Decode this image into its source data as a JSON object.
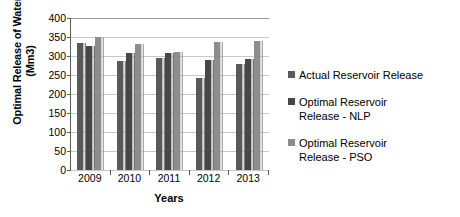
{
  "chart_data": {
    "type": "bar",
    "title": "",
    "xlabel": "Years",
    "ylabel": "Optimal Release of Water (Mm3)",
    "ylabel_line1": "Optimal Release of Water",
    "ylabel_line2": "(Mm3)",
    "categories": [
      "2009",
      "2010",
      "2011",
      "2012",
      "2013"
    ],
    "ylim": [
      0,
      400
    ],
    "yticks": [
      400,
      350,
      300,
      250,
      200,
      150,
      100,
      50,
      0
    ],
    "grid": true,
    "legend_position": "right",
    "series": [
      {
        "name": "Actual Reservoir Release",
        "color": "#595959",
        "values": [
          334,
          286,
          295,
          243,
          280
        ]
      },
      {
        "name": "Optimal Reservoir Release - NLP",
        "label_line1": "Optimal Reservoir",
        "label_line2": "Release - NLP",
        "color": "#474747",
        "values": [
          326,
          307,
          307,
          290,
          292
        ]
      },
      {
        "name": "Optimal Reservoir Release - PSO",
        "label_line1": "Optimal Reservoir",
        "label_line2": "Release - PSO",
        "color": "#8d8d8d",
        "values": [
          350,
          332,
          310,
          336,
          340
        ]
      }
    ]
  },
  "legend": {
    "items": [
      {
        "label": "Actual Reservoir Release",
        "color": "#595959"
      },
      {
        "label": "Optimal Reservoir\nRelease - NLP",
        "color": "#474747"
      },
      {
        "label": "Optimal Reservoir\nRelease - PSO",
        "color": "#8d8d8d"
      }
    ]
  }
}
